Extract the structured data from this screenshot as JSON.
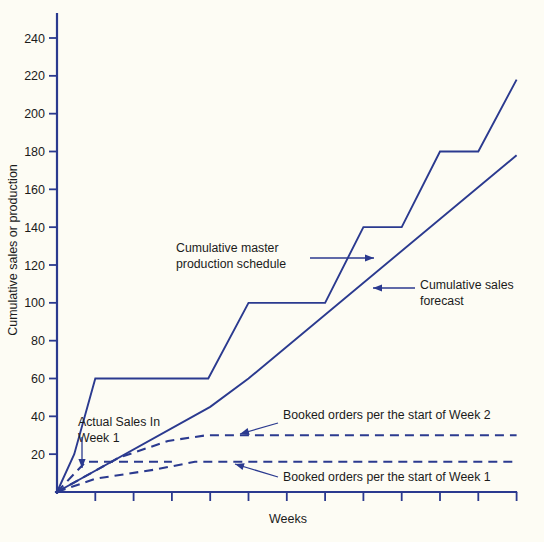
{
  "chart_data": {
    "type": "line",
    "title": "",
    "xlabel": "Weeks",
    "ylabel": "Cumulative sales or production",
    "ylim": [
      0,
      250
    ],
    "xlim": [
      0,
      12
    ],
    "grid": false,
    "legend_position": "inline-annotations",
    "ytick_labels": [
      "20",
      "40",
      "60",
      "80",
      "100",
      "120",
      "140",
      "160",
      "180",
      "200",
      "220",
      "240"
    ],
    "ytick_values": [
      20,
      40,
      60,
      80,
      100,
      120,
      140,
      160,
      180,
      200,
      220,
      240
    ],
    "xtick_values": [
      1,
      2,
      3,
      4,
      5,
      6,
      7,
      8,
      9,
      10,
      11,
      12
    ],
    "xtick_labels": [
      "",
      "",
      "",
      "",
      "",
      "",
      "",
      "",
      "",
      "",
      "",
      ""
    ],
    "series": [
      {
        "name": "Cumulative master production schedule",
        "style": "solid",
        "color": "#2b3a8f",
        "points": [
          {
            "x": 0.0,
            "y": 0
          },
          {
            "x": 0.45,
            "y": 20
          },
          {
            "x": 1.0,
            "y": 60
          },
          {
            "x": 3.95,
            "y": 60
          },
          {
            "x": 5.0,
            "y": 100
          },
          {
            "x": 7.0,
            "y": 100
          },
          {
            "x": 8.0,
            "y": 140
          },
          {
            "x": 9.0,
            "y": 140
          },
          {
            "x": 10.0,
            "y": 180
          },
          {
            "x": 11.0,
            "y": 180
          },
          {
            "x": 12.0,
            "y": 218
          }
        ]
      },
      {
        "name": "Cumulative sales forecast",
        "style": "solid",
        "color": "#2b3a8f",
        "points": [
          {
            "x": 0.0,
            "y": 0
          },
          {
            "x": 4.0,
            "y": 45
          },
          {
            "x": 5.0,
            "y": 60
          },
          {
            "x": 12.0,
            "y": 178
          }
        ]
      },
      {
        "name": "Booked orders per the start of Week 2",
        "style": "dashed",
        "color": "#2b3a8f",
        "points": [
          {
            "x": 0.0,
            "y": 0
          },
          {
            "x": 1.6,
            "y": 18
          },
          {
            "x": 2.9,
            "y": 27
          },
          {
            "x": 3.9,
            "y": 30
          },
          {
            "x": 12.0,
            "y": 30
          }
        ]
      },
      {
        "name": "Booked orders per the start of Week 1",
        "style": "dashed",
        "color": "#2b3a8f",
        "points": [
          {
            "x": 0.0,
            "y": 0
          },
          {
            "x": 1.0,
            "y": 7
          },
          {
            "x": 2.6,
            "y": 12
          },
          {
            "x": 3.6,
            "y": 16
          },
          {
            "x": 12.0,
            "y": 16
          }
        ]
      },
      {
        "name": "Actual sales in Week 1",
        "style": "dashed-flat",
        "color": "#2b3a8f",
        "points": [
          {
            "x": 0.0,
            "y": 0
          },
          {
            "x": 0.75,
            "y": 16
          },
          {
            "x": 3.0,
            "y": 16
          }
        ]
      }
    ],
    "annotations": [
      {
        "id": "mps",
        "text_lines": [
          "Cumulative master",
          "production schedule"
        ],
        "text_x": 176,
        "text_y": 252,
        "leader_from_x": 310,
        "leader_from_y": 258,
        "leader_to_x": 374,
        "leader_to_y": 258,
        "arrow": "right"
      },
      {
        "id": "forecast",
        "text_lines": [
          "Cumulative sales",
          "forecast"
        ],
        "text_x": 420,
        "text_y": 289,
        "leader_from_x": 415,
        "leader_from_y": 288,
        "leader_to_x": 373,
        "leader_to_y": 288,
        "arrow": "left"
      },
      {
        "id": "booked-week2",
        "text_lines": [
          "Booked orders per the start of Week 2"
        ],
        "text_x": 283,
        "text_y": 419,
        "leader_from_x": 278,
        "leader_from_y": 423,
        "leader_to_x": 240,
        "leader_to_y": 434,
        "arrow": "downleft"
      },
      {
        "id": "booked-week1",
        "text_lines": [
          "Booked orders per the start of Week 1"
        ],
        "text_x": 283,
        "text_y": 481,
        "leader_from_x": 278,
        "leader_from_y": 477,
        "leader_to_x": 235,
        "leader_to_y": 464,
        "arrow": "upleft"
      },
      {
        "id": "actual-sales",
        "text_lines": [
          "Actual Sales In",
          "Week 1"
        ],
        "text_x": 78,
        "text_y": 426,
        "leader_from_x": 82,
        "leader_from_y": 437,
        "leader_to_x": 82,
        "leader_to_y": 468,
        "arrow": "down"
      }
    ]
  },
  "axes": {
    "y_axis_title": "Cumulative sales or production",
    "x_axis_title": "Weeks"
  },
  "colors": {
    "line": "#2b3a8f",
    "axis": "#2b3a8f",
    "background": "#fdfcf4",
    "text": "#1b1b1b"
  }
}
